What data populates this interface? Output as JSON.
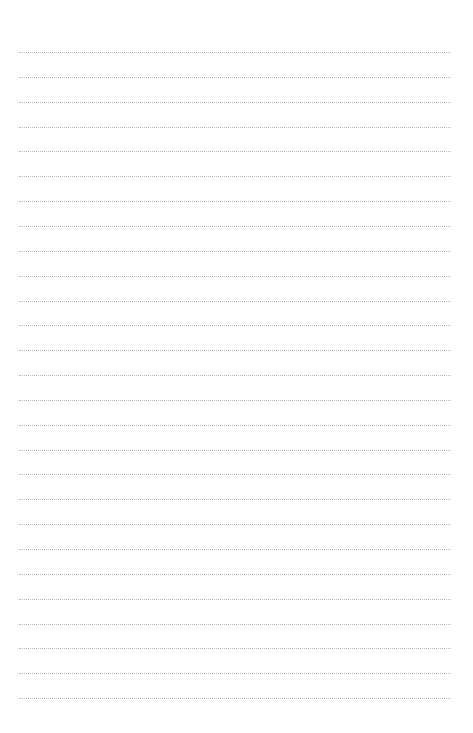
{
  "page": {
    "type": "lined-paper",
    "background": "#ffffff",
    "line_color": "#b8b8b8",
    "line_style": "dotted",
    "line_count": 27,
    "first_line_y": 52,
    "line_spacing": 24.85,
    "line_left": 19,
    "line_width": 432
  }
}
